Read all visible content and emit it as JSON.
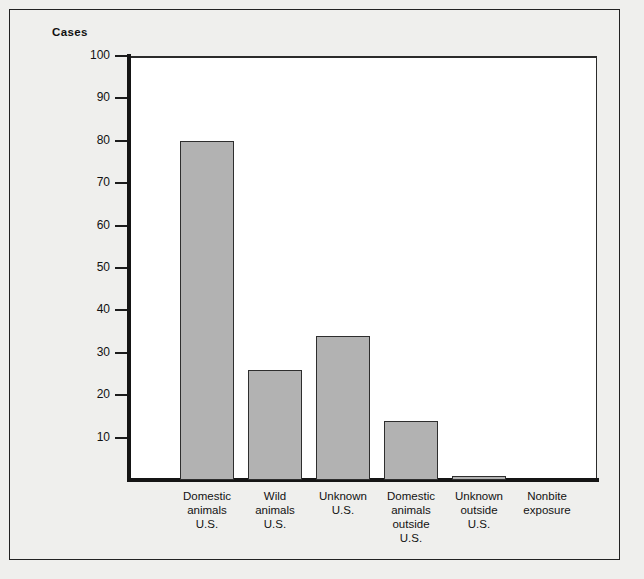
{
  "figure": {
    "axis_title": "Cases",
    "background_color": "#efefed",
    "plot_background_color": "#ffffff",
    "bar_fill_color": "#b2b2b2",
    "bar_border_color": "#2e2e2e",
    "axis_color": "#151515"
  },
  "chart_data": {
    "type": "bar",
    "title": "",
    "subtitle": "",
    "xlabel": "",
    "ylabel": "Cases",
    "ylim": [
      0,
      100
    ],
    "ytick_values": [
      10,
      20,
      30,
      40,
      50,
      60,
      70,
      80,
      90,
      100
    ],
    "ytick_labels": [
      "10",
      "20",
      "30",
      "40",
      "50",
      "60",
      "70",
      "80",
      "90",
      "100"
    ],
    "grid": false,
    "legend": null,
    "categories": [
      "Domestic animals U.S.",
      "Wild animals U.S.",
      "Unknown U.S.",
      "Domestic animals outside U.S.",
      "Unknown outside U.S.",
      "Nonbite exposure"
    ],
    "category_label_lines": [
      [
        "Domestic",
        "animals",
        "U.S."
      ],
      [
        "Wild",
        "animals",
        "U.S."
      ],
      [
        "Unknown",
        "U.S."
      ],
      [
        "Domestic",
        "animals",
        "outside",
        "U.S."
      ],
      [
        "Unknown",
        "outside",
        "U.S."
      ],
      [
        "Nonbite",
        "exposure"
      ]
    ],
    "values": [
      80,
      26,
      34,
      14,
      1,
      0
    ]
  }
}
